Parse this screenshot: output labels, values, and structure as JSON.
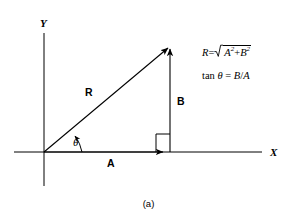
{
  "figure": {
    "caption": "(a)",
    "axes": {
      "x_label": "X",
      "y_label": "Y"
    },
    "vectors": [
      {
        "name": "resultant",
        "label": "R"
      },
      {
        "name": "horizontal-component",
        "label": "A"
      },
      {
        "name": "vertical-component",
        "label": "B"
      }
    ],
    "angle": {
      "label": "θ"
    },
    "right_angle_marker": "square",
    "formulas": {
      "magnitude": {
        "lhs": "R",
        "equals": "=",
        "radicand_a": "A",
        "exp_a": "2",
        "plus": "+",
        "radicand_b": "B",
        "exp_b": "2"
      },
      "tangent": {
        "fn": "tan",
        "theta": "θ",
        "equals": "=",
        "rhs_num": "B",
        "slash": "/",
        "rhs_den": "A"
      }
    },
    "colors": {
      "ink": "#000000",
      "background": "#ffffff"
    }
  }
}
